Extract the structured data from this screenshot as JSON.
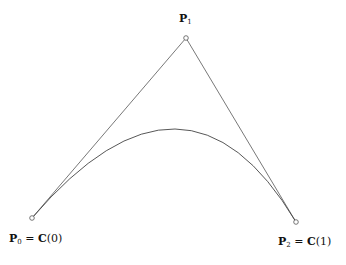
{
  "diagram": {
    "points": {
      "P0": {
        "x": 32,
        "y": 218,
        "label_main": "P",
        "label_sub": "0",
        "label_eq": " = ",
        "label_rhs": "C",
        "label_arg": "(0)"
      },
      "P1": {
        "x": 186,
        "y": 38,
        "label_main": "P",
        "label_sub": "1"
      },
      "P2": {
        "x": 296,
        "y": 222,
        "label_main": "P",
        "label_sub": "2",
        "label_eq": " = ",
        "label_rhs": "C",
        "label_arg": "(1)"
      }
    },
    "colors": {
      "line": "#555555",
      "curve": "#444444",
      "point": "#555555"
    }
  }
}
